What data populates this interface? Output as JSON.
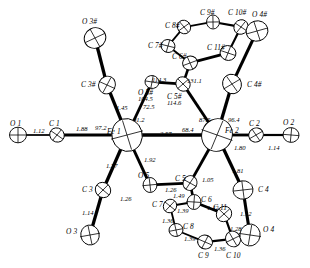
{
  "figure": {
    "type": "ortep-crystal-structure",
    "background_color": "#ffffff",
    "line_color": "#000000"
  },
  "atoms": [
    {
      "id": "O1",
      "label": "O 1",
      "x": 18,
      "y": 135,
      "r": 8.5,
      "lx": 10,
      "ly": 120
    },
    {
      "id": "C1",
      "label": "C 1",
      "x": 57,
      "y": 135,
      "r": 7.5,
      "lx": 49,
      "ly": 120
    },
    {
      "id": "Fe1",
      "label": "Fe 1",
      "x": 127,
      "y": 135,
      "r": 16.5,
      "lx": 107,
      "ly": 128
    },
    {
      "id": "Fe2",
      "label": "Fe 2",
      "x": 217,
      "y": 135,
      "r": 16.5,
      "lx": 225,
      "ly": 127
    },
    {
      "id": "C2",
      "label": "C 2",
      "x": 256,
      "y": 135,
      "r": 7.5,
      "lx": 249,
      "ly": 120
    },
    {
      "id": "O2",
      "label": "O 2",
      "x": 291,
      "y": 135,
      "r": 8.0,
      "lx": 283,
      "ly": 119
    },
    {
      "id": "C3",
      "label": "C 3",
      "x": 103,
      "y": 190,
      "r": 8.0,
      "lx": 82,
      "ly": 186
    },
    {
      "id": "O3",
      "label": "O 3",
      "x": 90,
      "y": 235,
      "r": 10.0,
      "lx": 66,
      "ly": 228
    },
    {
      "id": "C3#",
      "label": "C 3#",
      "x": 107,
      "y": 85,
      "r": 9.0,
      "lx": 81,
      "ly": 81
    },
    {
      "id": "O3#",
      "label": "O 3#",
      "x": 95,
      "y": 38,
      "r": 11.0,
      "lx": 82,
      "ly": 18
    },
    {
      "id": "O5#",
      "label": "O 5#",
      "x": 152,
      "y": 82,
      "r": 7.0,
      "lx": 138,
      "ly": 89
    },
    {
      "id": "C5#",
      "label": "C 5#",
      "x": 183,
      "y": 84,
      "r": 7.5,
      "lx": 167,
      "ly": 93
    },
    {
      "id": "O5",
      "label": "O 5",
      "x": 150,
      "y": 185,
      "r": 7.5,
      "lx": 138,
      "ly": 172
    },
    {
      "id": "C5",
      "label": "C 5",
      "x": 190,
      "y": 183,
      "r": 7.5,
      "lx": 175,
      "ly": 175
    },
    {
      "id": "C6#",
      "label": "C 6#",
      "x": 190,
      "y": 63,
      "r": 7.5,
      "lx": 172,
      "ly": 53
    },
    {
      "id": "C7#",
      "label": "C 7#",
      "x": 168,
      "y": 46,
      "r": 7.0,
      "lx": 148,
      "ly": 42
    },
    {
      "id": "C8#",
      "label": "C 8#",
      "x": 184,
      "y": 27,
      "r": 7.0,
      "lx": 165,
      "ly": 22
    },
    {
      "id": "C9#",
      "label": "C 9#",
      "x": 213,
      "y": 22,
      "r": 7.0,
      "lx": 200,
      "ly": 9
    },
    {
      "id": "C10#",
      "label": "C 10#",
      "x": 241,
      "y": 27,
      "r": 7.5,
      "lx": 228,
      "ly": 9
    },
    {
      "id": "O4#",
      "label": "O 4#",
      "x": 257,
      "y": 31,
      "r": 11.0,
      "lx": 252,
      "ly": 11
    },
    {
      "id": "C11#",
      "label": "C 11#",
      "x": 228,
      "y": 53,
      "r": 8.0,
      "lx": 207,
      "ly": 44
    },
    {
      "id": "C4#",
      "label": "C 4#",
      "x": 232,
      "y": 84,
      "r": 10.0,
      "lx": 247,
      "ly": 81
    },
    {
      "id": "C6",
      "label": "C 6",
      "x": 194,
      "y": 202,
      "r": 7.5,
      "lx": 201,
      "ly": 196
    },
    {
      "id": "C7",
      "label": "C 7",
      "x": 170,
      "y": 206,
      "r": 7.0,
      "lx": 152,
      "ly": 201
    },
    {
      "id": "C8",
      "label": "C 8",
      "x": 176,
      "y": 230,
      "r": 7.0,
      "lx": 183,
      "ly": 223
    },
    {
      "id": "C9",
      "label": "C 9",
      "x": 205,
      "y": 242,
      "r": 7.5,
      "lx": 198,
      "ly": 252
    },
    {
      "id": "C10",
      "label": "C 10",
      "x": 233,
      "y": 239,
      "r": 8.0,
      "lx": 226,
      "ly": 252
    },
    {
      "id": "O4",
      "label": "O 4",
      "x": 250,
      "y": 235,
      "r": 11.0,
      "lx": 263,
      "ly": 226
    },
    {
      "id": "C11",
      "label": "C 11",
      "x": 224,
      "y": 214,
      "r": 8.0,
      "lx": 213,
      "ly": 204
    },
    {
      "id": "C4",
      "label": "C 4",
      "x": 243,
      "y": 190,
      "r": 10.0,
      "lx": 258,
      "ly": 186
    }
  ],
  "bonds": [
    {
      "from": "O1",
      "to": "C1",
      "w": 1.6
    },
    {
      "from": "C1",
      "to": "Fe1",
      "w": 2.6
    },
    {
      "from": "Fe1",
      "to": "Fe2",
      "w": 3.0
    },
    {
      "from": "Fe2",
      "to": "C2",
      "w": 2.6
    },
    {
      "from": "C2",
      "to": "O2",
      "w": 2.0
    },
    {
      "from": "Fe1",
      "to": "C3",
      "w": 3.0
    },
    {
      "from": "C3",
      "to": "O3",
      "w": 3.0
    },
    {
      "from": "Fe1",
      "to": "C3#",
      "w": 3.0
    },
    {
      "from": "C3#",
      "to": "O3#",
      "w": 3.0
    },
    {
      "from": "Fe1",
      "to": "O5#",
      "w": 2.6
    },
    {
      "from": "O5#",
      "to": "C5#",
      "w": 2.4
    },
    {
      "from": "C5#",
      "to": "Fe2",
      "w": 2.6
    },
    {
      "from": "Fe1",
      "to": "O5",
      "w": 2.6
    },
    {
      "from": "O5",
      "to": "C5",
      "w": 2.4
    },
    {
      "from": "C5",
      "to": "Fe2",
      "w": 2.6
    },
    {
      "from": "C5#",
      "to": "C6#",
      "w": 2.4
    },
    {
      "from": "C6#",
      "to": "C7#",
      "w": 1.8
    },
    {
      "from": "C7#",
      "to": "C8#",
      "w": 1.6
    },
    {
      "from": "C8#",
      "to": "C9#",
      "w": 1.6
    },
    {
      "from": "C9#",
      "to": "C10#",
      "w": 2.0
    },
    {
      "from": "C10#",
      "to": "O4#",
      "w": 2.4
    },
    {
      "from": "C10#",
      "to": "C11#",
      "w": 2.0
    },
    {
      "from": "C11#",
      "to": "C6#",
      "w": 2.6
    },
    {
      "from": "O4#",
      "to": "C4#",
      "w": 2.8
    },
    {
      "from": "C4#",
      "to": "Fe2",
      "w": 3.0
    },
    {
      "from": "C5",
      "to": "C6",
      "w": 2.4
    },
    {
      "from": "C6",
      "to": "C7",
      "w": 1.8
    },
    {
      "from": "C7",
      "to": "C8",
      "w": 1.6
    },
    {
      "from": "C8",
      "to": "C9",
      "w": 1.6
    },
    {
      "from": "C9",
      "to": "C10",
      "w": 2.0
    },
    {
      "from": "C10",
      "to": "O4",
      "w": 2.4
    },
    {
      "from": "C10",
      "to": "C11",
      "w": 2.0
    },
    {
      "from": "C11",
      "to": "C6",
      "w": 2.4
    },
    {
      "from": "O4",
      "to": "C4",
      "w": 2.8
    },
    {
      "from": "C4",
      "to": "Fe2",
      "w": 3.0
    }
  ],
  "bond_labels": [
    {
      "text": "1.12",
      "x": 33,
      "y": 128
    },
    {
      "text": "1.88",
      "x": 76,
      "y": 126
    },
    {
      "text": "2.57",
      "x": 160,
      "y": 131
    },
    {
      "text": "1.80",
      "x": 234,
      "y": 145
    },
    {
      "text": "1.14",
      "x": 268,
      "y": 145
    },
    {
      "text": "1.77",
      "x": 106,
      "y": 163
    },
    {
      "text": "1.14",
      "x": 82,
      "y": 210
    },
    {
      "text": "1.92",
      "x": 144,
      "y": 157
    },
    {
      "text": "1.26",
      "x": 165,
      "y": 187
    },
    {
      "text": "1.49",
      "x": 173,
      "y": 193
    },
    {
      "text": "1.39",
      "x": 177,
      "y": 208
    },
    {
      "text": "1.36",
      "x": 162,
      "y": 218
    },
    {
      "text": "1.39",
      "x": 184,
      "y": 236
    },
    {
      "text": "1.36",
      "x": 214,
      "y": 246
    },
    {
      "text": "1.42",
      "x": 207,
      "y": 205
    },
    {
      "text": "1.28",
      "x": 230,
      "y": 226
    },
    {
      "text": "1.12",
      "x": 240,
      "y": 211
    },
    {
      "text": "1.81",
      "x": 232,
      "y": 168
    },
    {
      "text": "1.05",
      "x": 202,
      "y": 177
    },
    {
      "text": "1.45",
      "x": 116,
      "y": 105
    }
  ],
  "angle_labels": [
    {
      "text": "97.2",
      "x": 95,
      "y": 125
    },
    {
      "text": "91.2",
      "x": 133,
      "y": 117
    },
    {
      "text": "104.5",
      "x": 138,
      "y": 96
    },
    {
      "text": "72.5",
      "x": 143,
      "y": 104
    },
    {
      "text": "114.6",
      "x": 167,
      "y": 100
    },
    {
      "text": "114.3",
      "x": 152,
      "y": 77
    },
    {
      "text": "131.1",
      "x": 187,
      "y": 78
    },
    {
      "text": "68.4",
      "x": 182,
      "y": 127
    },
    {
      "text": "87.5",
      "x": 199,
      "y": 117
    },
    {
      "text": "96.4",
      "x": 228,
      "y": 117
    },
    {
      "text": "1.26",
      "x": 120,
      "y": 196
    }
  ]
}
